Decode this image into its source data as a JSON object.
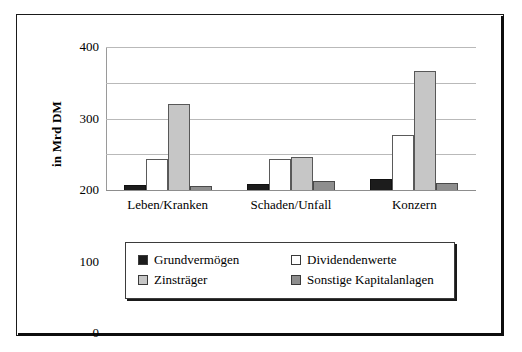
{
  "chart_data": {
    "type": "bar",
    "title": "",
    "xlabel": "",
    "ylabel": "in Mrd DM",
    "ylim": [
      0,
      400
    ],
    "yticks": [
      0,
      100,
      200,
      300,
      400
    ],
    "grid": true,
    "legend_position": "bottom",
    "categories": [
      "Leben/Kranken",
      "Schaden/Unfall",
      "Konzern"
    ],
    "series": [
      {
        "name": "Grundvermögen",
        "color": "#1c1c1c",
        "values": [
          13,
          18,
          32
        ]
      },
      {
        "name": "Dividendenwerte",
        "color": "#ffffff",
        "values": [
          86,
          88,
          154
        ]
      },
      {
        "name": "Zinsträger",
        "color": "#c6c6c6",
        "values": [
          240,
          91,
          334
        ]
      },
      {
        "name": "Sonstige Kapitalanlagen",
        "color": "#8e8e8e",
        "values": [
          10,
          25,
          20
        ]
      }
    ]
  }
}
